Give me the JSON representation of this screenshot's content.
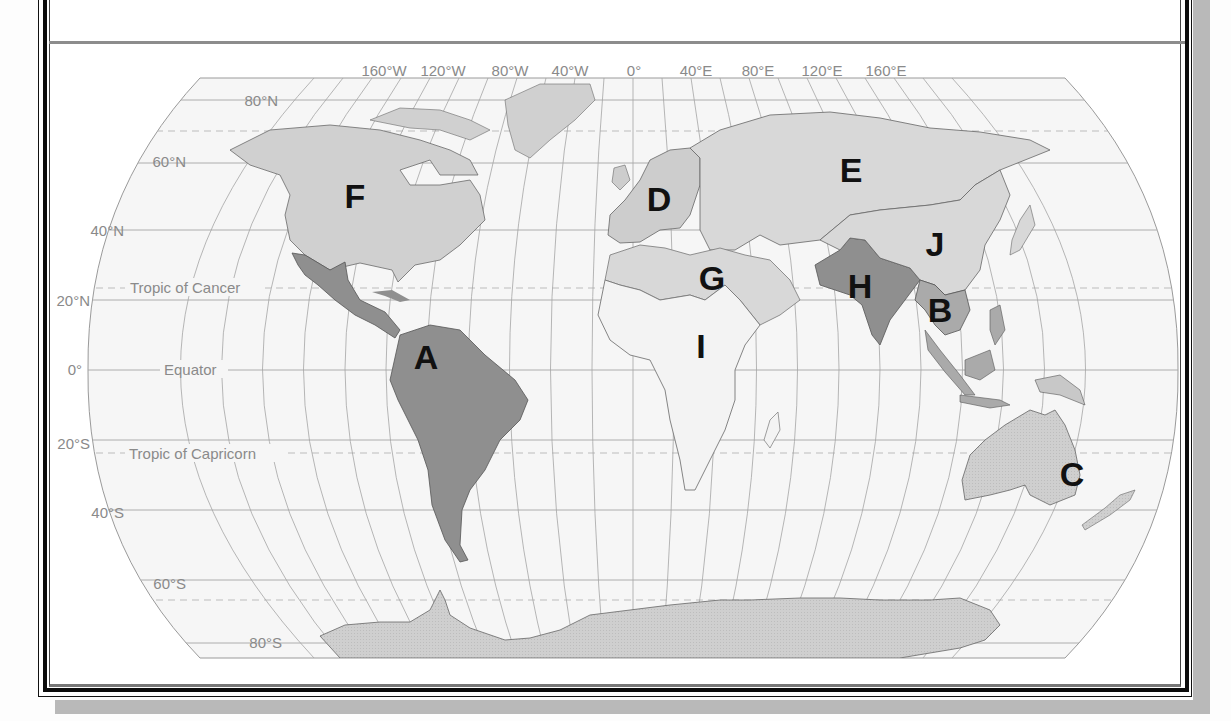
{
  "title_fragment": "",
  "map": {
    "projection": "Robinson",
    "longitude_labels": [
      "160°W",
      "120°W",
      "80°W",
      "40°W",
      "0°",
      "40°E",
      "80°E",
      "120°E",
      "160°E"
    ],
    "latitude_labels": [
      "80°N",
      "60°N",
      "40°N",
      "20°N",
      "0°",
      "20°S",
      "40°S",
      "60°S",
      "80°S"
    ],
    "line_labels": {
      "tropic_cancer": "Tropic of Cancer",
      "equator": "Equator",
      "tropic_capricorn": "Tropic of Capricorn"
    },
    "regions": [
      {
        "letter": "A",
        "area": "Latin America"
      },
      {
        "letter": "B",
        "area": "Southeast Asia"
      },
      {
        "letter": "C",
        "area": "Australia / Oceania"
      },
      {
        "letter": "D",
        "area": "Europe"
      },
      {
        "letter": "E",
        "area": "Russia / Central Asia"
      },
      {
        "letter": "F",
        "area": "North America"
      },
      {
        "letter": "G",
        "area": "North Africa / Middle East"
      },
      {
        "letter": "H",
        "area": "South Asia"
      },
      {
        "letter": "I",
        "area": "Sub-Saharan Africa"
      },
      {
        "letter": "J",
        "area": "East Asia"
      }
    ],
    "colors": {
      "ocean": "#f6f6f6",
      "graticule": "#9a9a9a",
      "light_region": "#d2d2d2",
      "medium_region": "#bdbdbd",
      "dark_region": "#8f8f8f",
      "africa": "#f7f7f7",
      "label_text": "#8a8a8a",
      "letter": "#111111"
    }
  }
}
